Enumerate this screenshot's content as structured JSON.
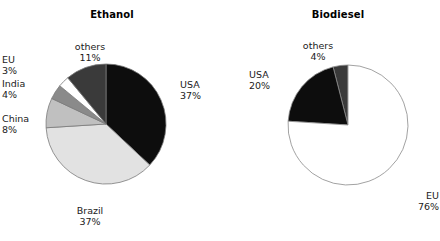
{
  "chart_data": [
    {
      "type": "pie",
      "title": "Ethanol",
      "categories": [
        "USA",
        "Brazil",
        "China",
        "India",
        "EU",
        "others"
      ],
      "values": [
        37,
        37,
        8,
        4,
        3,
        11
      ],
      "value_labels": [
        "37%",
        "37%",
        "8%",
        "4%",
        "3%",
        "11%"
      ],
      "unit": "%",
      "start_angle_deg": 0,
      "direction": "clockwise",
      "legend": "none",
      "slice_colors": [
        "#0d0d0d",
        "#e2e2e2",
        "#c0c0c0",
        "#8a8a8a",
        "#ffffff",
        "#3a3a3a"
      ],
      "outline_color": "#7a7a7a"
    },
    {
      "type": "pie",
      "title": "Biodiesel",
      "categories": [
        "others",
        "USA",
        "EU"
      ],
      "values": [
        4,
        20,
        76
      ],
      "value_labels": [
        "4%",
        "20%",
        "76%"
      ],
      "unit": "%",
      "start_angle_deg": 0,
      "direction": "counter-clockwise",
      "legend": "none",
      "slice_colors": [
        "#3a3a3a",
        "#0d0d0d",
        "#ffffff"
      ],
      "outline_color": "#8a8a8a"
    }
  ],
  "ethanol": {
    "title": "Ethanol",
    "labels": {
      "usa": {
        "name": "USA",
        "pct": "37%"
      },
      "brazil": {
        "name": "Brazil",
        "pct": "37%"
      },
      "china": {
        "name": "China",
        "pct": "8%"
      },
      "india": {
        "name": "India",
        "pct": "4%"
      },
      "eu": {
        "name": "EU",
        "pct": "3%"
      },
      "others": {
        "name": "others",
        "pct": "11%"
      }
    }
  },
  "biodiesel": {
    "title": "Biodiesel",
    "labels": {
      "others": {
        "name": "others",
        "pct": "4%"
      },
      "usa": {
        "name": "USA",
        "pct": "20%"
      },
      "eu": {
        "name": "EU",
        "pct": "76%"
      }
    }
  }
}
